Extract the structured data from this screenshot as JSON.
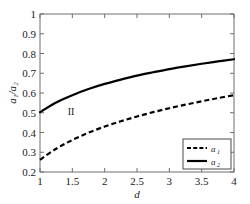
{
  "chart_data": {
    "type": "line",
    "title": "",
    "xlabel": "d",
    "ylabel": "a₁/a₂",
    "xlim": [
      1,
      4
    ],
    "ylim": [
      0.2,
      1
    ],
    "grid": false,
    "legend_position": "lower-right",
    "x_ticks": [
      "1",
      "1.5",
      "2",
      "2.5",
      "3",
      "3.5",
      "4"
    ],
    "x_tick_values": [
      1,
      1.5,
      2,
      2.5,
      3,
      3.5,
      4
    ],
    "y_ticks": [
      "0.2",
      "0.3",
      "0.4",
      "0.5",
      "0.6",
      "0.7",
      "0.8",
      "0.9",
      "1"
    ],
    "y_tick_values": [
      0.2,
      0.3,
      0.4,
      0.5,
      0.6,
      0.7,
      0.8,
      0.9,
      1
    ],
    "x": [
      1,
      1.25,
      1.5,
      1.75,
      2,
      2.25,
      2.5,
      2.75,
      3,
      3.25,
      3.5,
      3.75,
      4
    ],
    "series": [
      {
        "name": "a₁",
        "style": "dashed",
        "color": "#000000",
        "values": [
          0.262,
          0.318,
          0.362,
          0.399,
          0.43,
          0.457,
          0.481,
          0.503,
          0.523,
          0.541,
          0.558,
          0.574,
          0.589
        ]
      },
      {
        "name": "a₂",
        "style": "solid",
        "color": "#000000",
        "values": [
          0.503,
          0.552,
          0.589,
          0.62,
          0.646,
          0.668,
          0.688,
          0.705,
          0.721,
          0.735,
          0.748,
          0.76,
          0.771
        ]
      }
    ],
    "annotations": [
      {
        "text": "II",
        "x": 1.48,
        "y": 0.505
      }
    ],
    "legend": [
      {
        "label": "a",
        "sub": "1",
        "style": "dashed"
      },
      {
        "label": "a",
        "sub": "2",
        "style": "solid"
      }
    ],
    "axis_color": "#6e6e6e",
    "curve_color": "#000000",
    "background": "#ffffff"
  }
}
